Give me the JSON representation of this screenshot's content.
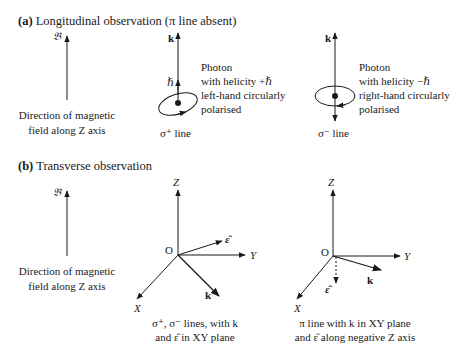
{
  "section_a": {
    "label": "(a)",
    "title": "Longitudinal observation (π line absent)",
    "field_symbol": "𝔅",
    "field_caption_1": "Direction of magnetic",
    "field_caption_2": "field along Z axis",
    "sigma_plus": {
      "k_label": "k",
      "hbar_label": "ℏ",
      "desc_1": "Photon",
      "desc_2": "with helicity +ℏ",
      "desc_3": "left-hand circularly",
      "desc_4": "polarised",
      "line_label": "σ⁺ line"
    },
    "sigma_minus": {
      "k_label": "k",
      "desc_1": "Photon",
      "desc_2": "with helicity −ℏ",
      "desc_3": "right-hand circularly",
      "desc_4": "polarised",
      "line_label": "σ⁻ line"
    }
  },
  "section_b": {
    "label": "(b)",
    "title": "Transverse observation",
    "field_symbol": "𝔅",
    "field_caption_1": "Direction of magnetic",
    "field_caption_2": "field along Z axis",
    "sigma_axes": {
      "z": "Z",
      "y": "Y",
      "x": "X",
      "origin": "O",
      "k": "k",
      "eps": "ε̂",
      "caption_1": "σ⁺, σ⁻ lines, with k",
      "caption_2": "and ε̂ in XY plane"
    },
    "pi_axes": {
      "z": "Z",
      "y": "Y",
      "x": "X",
      "origin": "O",
      "k": "k",
      "eps": "ε̂",
      "caption_1": "π line with k in XY plane",
      "caption_2": "and ε̂ along negative Z axis"
    }
  },
  "colors": {
    "ink": "#1a1a1a",
    "background": "#ffffff"
  }
}
